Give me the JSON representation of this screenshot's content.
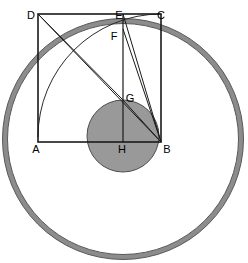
{
  "figure": {
    "width": 248,
    "height": 263,
    "background": "#ffffff",
    "colors": {
      "stroke": "#1a1a1a",
      "ring_fill": "#999999",
      "ring_stroke": "#4d4d4d",
      "inner_circle_fill": "#999999",
      "inner_circle_stroke": "#4d4d4d",
      "label_color": "#000000"
    },
    "outer_ring": {
      "name": "outer-ring-circle",
      "cx": 123,
      "cy": 139,
      "radius": 118,
      "band_thickness": 4
    },
    "inner_circle": {
      "name": "inner-shaded-circle",
      "cx": 123,
      "cy": 136,
      "radius": 36
    },
    "square": {
      "name": "square-ABCD",
      "left": 38,
      "top": 14,
      "right": 161,
      "bottom": 142
    },
    "arc": {
      "name": "quarter-arc-from-D-to-B",
      "center_x": 38,
      "center_y": 14,
      "radius": 123,
      "start": "D-side-bottom",
      "end": "C-top"
    },
    "points": [
      {
        "id": "A",
        "label": "A",
        "x": 38,
        "y": 142,
        "label_x": 33,
        "label_y": 152
      },
      {
        "id": "B",
        "label": "B",
        "x": 161,
        "y": 142,
        "label_x": 164,
        "label_y": 152
      },
      {
        "id": "C",
        "label": "C",
        "x": 161,
        "y": 14,
        "label_x": 160,
        "label_y": 11
      },
      {
        "id": "D",
        "label": "D",
        "x": 38,
        "y": 14,
        "label_x": 31,
        "label_y": 11
      },
      {
        "id": "E",
        "label": "E",
        "x": 123,
        "y": 14,
        "label_x": 119,
        "label_y": 11
      },
      {
        "id": "F",
        "label": "F",
        "x": 123,
        "y": 30,
        "label_x": 113,
        "label_y": 37
      },
      {
        "id": "G",
        "label": "G",
        "x": 123,
        "y": 100,
        "label_x": 126,
        "label_y": 99
      },
      {
        "id": "H",
        "label": "H",
        "x": 123,
        "y": 142,
        "label_x": 118,
        "label_y": 153
      }
    ],
    "segments": [
      {
        "name": "segment-AB",
        "from": "A",
        "to": "B"
      },
      {
        "name": "segment-BC",
        "from": "B",
        "to": "C"
      },
      {
        "name": "segment-CD",
        "from": "C",
        "to": "D"
      },
      {
        "name": "segment-DA",
        "from": "D",
        "to": "A"
      },
      {
        "name": "segment-EH",
        "from": "E",
        "to": "H"
      },
      {
        "name": "segment-DB",
        "from": "D",
        "to": "B"
      },
      {
        "name": "segment-DG",
        "from": "D",
        "to": "G"
      },
      {
        "name": "segment-GB",
        "from": "G",
        "to": "B"
      },
      {
        "name": "segment-FB",
        "from": "F",
        "to": "B"
      },
      {
        "name": "segment-EB",
        "from": "E",
        "to": "B"
      }
    ]
  }
}
